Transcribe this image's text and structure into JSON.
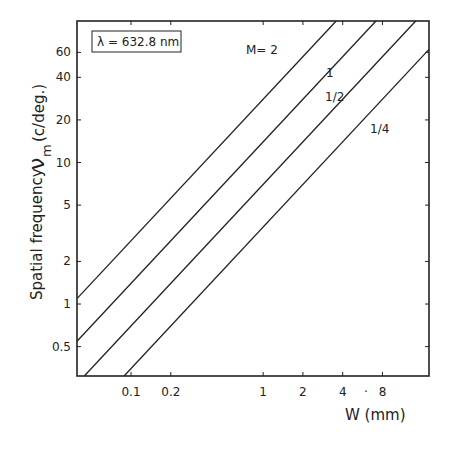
{
  "chart_data": {
    "type": "line",
    "title": "",
    "xlabel": "W (mm)",
    "ylabel_main": "Spatial frequency",
    "ylabel_symbol": "ν",
    "ylabel_subscript": "m",
    "ylabel_unit": "(c/deg.)",
    "x_scale": "log",
    "y_scale": "log",
    "xlim": [
      0.039,
      18
    ],
    "ylim": [
      0.31,
      100
    ],
    "x_ticks": [
      0.1,
      0.2,
      1,
      2,
      4,
      8
    ],
    "x_tick_labels": [
      "0.1",
      "0.2",
      "1",
      "2",
      "4",
      "8"
    ],
    "x_extra_mark": "·",
    "y_ticks": [
      0.5,
      1,
      2,
      5,
      10,
      20,
      40,
      60
    ],
    "y_tick_labels": [
      "0.5",
      "1",
      "2",
      "5",
      "10",
      "20",
      "40",
      "60"
    ],
    "grid": false,
    "annotation_box": "λ = 632.8 nm",
    "series": [
      {
        "name": "M=2",
        "label": "M= 2",
        "slope": 1,
        "coef": 28,
        "x": [
          0.039,
          3.6
        ],
        "y": [
          1.1,
          100
        ]
      },
      {
        "name": "M=1",
        "label": "1",
        "slope": 1,
        "coef": 14,
        "x": [
          0.039,
          7.1
        ],
        "y": [
          0.55,
          100
        ]
      },
      {
        "name": "M=1/2",
        "label": "1/2",
        "slope": 1,
        "coef": 7,
        "x": [
          0.044,
          14.3
        ],
        "y": [
          0.31,
          100
        ]
      },
      {
        "name": "M=1/4",
        "label": "1/4",
        "slope": 1,
        "coef": 3.5,
        "x": [
          0.089,
          18
        ],
        "y": [
          0.31,
          63
        ]
      }
    ]
  }
}
